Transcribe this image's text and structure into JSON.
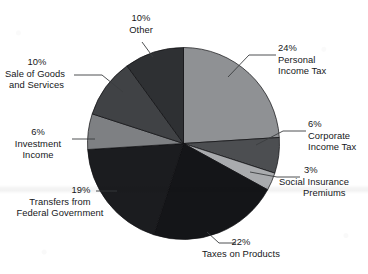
{
  "chart_data": {
    "type": "pie",
    "title": "",
    "xlabel": "",
    "ylabel": "",
    "legend_position": "none",
    "grid": false,
    "units": "percent",
    "total": 100,
    "start_angle_deg": 0,
    "direction": "clockwise",
    "categories": [
      "Personal Income Tax",
      "Corporate Income Tax",
      "Social Insurance Premiums",
      "Taxes on Products",
      "Transfers from Federal Government",
      "Investment Income",
      "Sale of Goods and Services",
      "Other"
    ],
    "values": [
      24,
      6,
      3,
      22,
      19,
      6,
      10,
      10
    ],
    "colors": [
      "#8f9194",
      "#4c4e51",
      "#a9abae",
      "#141518",
      "#1b1c1f",
      "#7e8083",
      "#404245",
      "#2e3033"
    ],
    "slices": [
      {
        "label": "Personal Income Tax",
        "label_line1": "Personal",
        "label_line2": "Income Tax",
        "percent_text": "24%",
        "value": 24,
        "color": "#8f9194"
      },
      {
        "label": "Corporate Income Tax",
        "label_line1": "Corporate",
        "label_line2": "Income Tax",
        "percent_text": "6%",
        "value": 6,
        "color": "#4c4e51"
      },
      {
        "label": "Social Insurance Premiums",
        "label_line1": "Social Insurance",
        "label_line2": "Premiums",
        "percent_text": "3%",
        "value": 3,
        "color": "#a9abae"
      },
      {
        "label": "Taxes on Products",
        "label_line1": "Taxes on Products",
        "label_line2": "",
        "percent_text": "22%",
        "value": 22,
        "color": "#141518"
      },
      {
        "label": "Transfers from Federal Government",
        "label_line1": "Transfers from",
        "label_line2": "Federal Government",
        "percent_text": "19%",
        "value": 19,
        "color": "#1b1c1f"
      },
      {
        "label": "Investment Income",
        "label_line1": "Investment",
        "label_line2": "Income",
        "percent_text": "6%",
        "value": 6,
        "color": "#7e8083"
      },
      {
        "label": "Sale of Goods and Services",
        "label_line1": "Sale of Goods",
        "label_line2": "and Services",
        "percent_text": "10%",
        "value": 10,
        "color": "#404245"
      },
      {
        "label": "Other",
        "label_line1": "Other",
        "label_line2": "",
        "percent_text": "10%",
        "value": 10,
        "color": "#2e3033"
      }
    ]
  },
  "labels": {
    "personal_pct": "24%",
    "personal_l1": "Personal",
    "personal_l2": "Income Tax",
    "corporate_pct": "6%",
    "corporate_l1": "Corporate",
    "corporate_l2": "Income Tax",
    "social_pct": "3%",
    "social_l1": "Social Insurance",
    "social_l2": "Premiums",
    "products_pct": "22%",
    "products_l1": "Taxes on Products",
    "transfers_pct": "19%",
    "transfers_l1": "Transfers from",
    "transfers_l2": "Federal Government",
    "investment_pct": "6%",
    "investment_l1": "Investment",
    "investment_l2": "Income",
    "goods_pct": "10%",
    "goods_l1": "Sale of Goods",
    "goods_l2": "and Services",
    "other_pct": "10%",
    "other_l1": "Other"
  }
}
